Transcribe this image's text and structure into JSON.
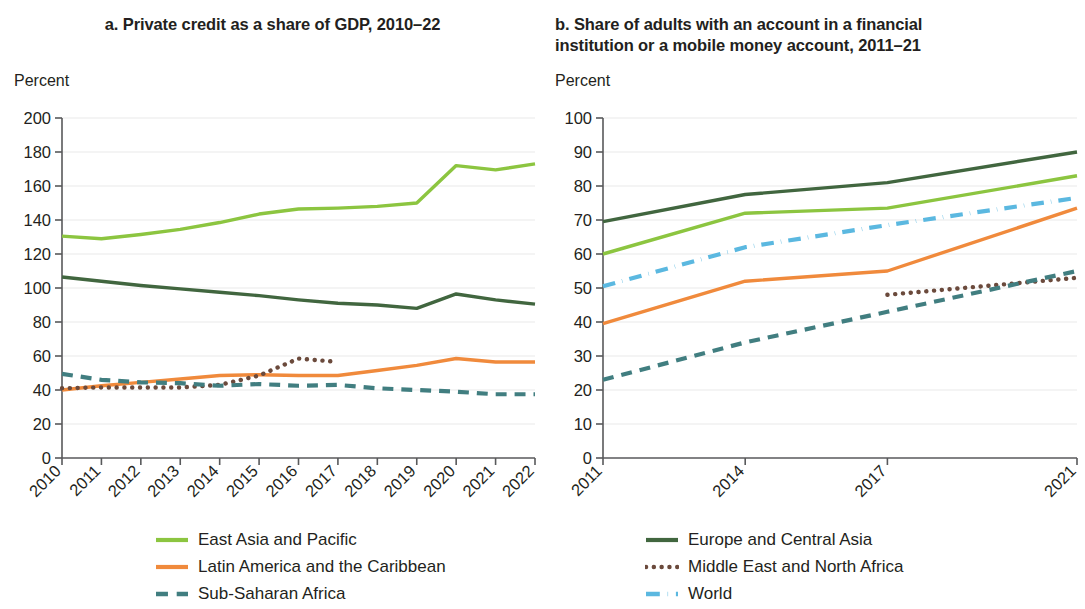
{
  "figure": {
    "legend": [
      {
        "name": "East Asia and Pacific",
        "color": "#8CC540",
        "style": "solid"
      },
      {
        "name": "Europe and Central Asia",
        "color": "#41663F",
        "style": "solid"
      },
      {
        "name": "Latin America and the Caribbean",
        "color": "#F08A3C",
        "style": "solid"
      },
      {
        "name": "Middle East and North Africa",
        "color": "#6B4A3C",
        "style": "dotted"
      },
      {
        "name": "Sub-Saharan Africa",
        "color": "#417E80",
        "style": "dashed"
      },
      {
        "name": "World",
        "color": "#5BB8E0",
        "style": "dashdot"
      }
    ]
  },
  "chart_data": [
    {
      "type": "line",
      "panel": "a",
      "title": "a. Private credit as a share of GDP, 2010–22",
      "ylabel": "Percent",
      "xlabel": "",
      "ylim": [
        0,
        200
      ],
      "yticks": [
        0,
        20,
        40,
        60,
        80,
        100,
        120,
        140,
        160,
        180,
        200
      ],
      "grid": true,
      "legend_position": "bottom",
      "x": [
        2010,
        2011,
        2012,
        2013,
        2014,
        2015,
        2016,
        2017,
        2018,
        2019,
        2020,
        2021,
        2022
      ],
      "xticklabels": [
        "2010",
        "2011",
        "2012",
        "2013",
        "2014",
        "2015",
        "2016",
        "2017",
        "2018",
        "2019",
        "2020",
        "2021",
        "2022"
      ],
      "series": [
        {
          "name": "East Asia and Pacific",
          "color": "#8CC540",
          "style": "solid",
          "values": [
            130.5,
            129.0,
            131.5,
            134.5,
            138.5,
            143.5,
            146.5,
            147.0,
            148.0,
            150.0,
            172.0,
            169.5,
            173.0
          ]
        },
        {
          "name": "Europe and Central Asia",
          "color": "#41663F",
          "style": "solid",
          "values": [
            106.5,
            104.0,
            101.5,
            99.5,
            97.5,
            95.5,
            93.0,
            91.0,
            90.0,
            88.0,
            96.5,
            93.0,
            90.5
          ]
        },
        {
          "name": "Latin America and the Caribbean",
          "color": "#F08A3C",
          "style": "solid",
          "values": [
            40.0,
            42.5,
            44.5,
            46.5,
            48.5,
            49.0,
            48.5,
            48.5,
            51.5,
            54.5,
            58.5,
            56.5,
            56.5
          ]
        },
        {
          "name": "Middle East and North Africa",
          "color": "#6B4A3C",
          "style": "dotted",
          "values": [
            41.0,
            41.5,
            41.5,
            41.5,
            43.0,
            48.5,
            58.5,
            56.5,
            null,
            null,
            null,
            null,
            null
          ]
        },
        {
          "name": "Sub-Saharan Africa",
          "color": "#417E80",
          "style": "dashed",
          "values": [
            49.5,
            46.0,
            44.5,
            44.0,
            42.5,
            43.5,
            42.5,
            43.0,
            41.0,
            40.0,
            39.0,
            37.5,
            37.5
          ]
        }
      ]
    },
    {
      "type": "line",
      "panel": "b",
      "title": "b. Share of adults with an account in a financial institution or a mobile money account, 2011–21",
      "ylabel": "Percent",
      "xlabel": "",
      "ylim": [
        0,
        100
      ],
      "yticks": [
        0,
        10,
        20,
        30,
        40,
        50,
        60,
        70,
        80,
        90,
        100
      ],
      "grid": true,
      "legend_position": "bottom",
      "x": [
        2011,
        2014,
        2017,
        2021
      ],
      "xticklabels": [
        "2011",
        "2014",
        "2017",
        "2021"
      ],
      "series": [
        {
          "name": "East Asia and Pacific",
          "color": "#8CC540",
          "style": "solid",
          "values": [
            60.0,
            72.0,
            73.5,
            83.0
          ]
        },
        {
          "name": "Europe and Central Asia",
          "color": "#41663F",
          "style": "solid",
          "values": [
            69.5,
            77.5,
            81.0,
            90.0
          ]
        },
        {
          "name": "Latin America and the Caribbean",
          "color": "#F08A3C",
          "style": "solid",
          "values": [
            39.5,
            52.0,
            55.0,
            73.5
          ]
        },
        {
          "name": "Middle East and North Africa",
          "color": "#6B4A3C",
          "style": "dotted",
          "values": [
            null,
            null,
            48.0,
            53.0
          ]
        },
        {
          "name": "Sub-Saharan Africa",
          "color": "#417E80",
          "style": "dashed",
          "values": [
            23.0,
            34.0,
            43.0,
            55.0
          ]
        },
        {
          "name": "World",
          "color": "#5BB8E0",
          "style": "dashdot",
          "values": [
            50.5,
            62.0,
            68.5,
            76.5
          ]
        }
      ]
    }
  ]
}
